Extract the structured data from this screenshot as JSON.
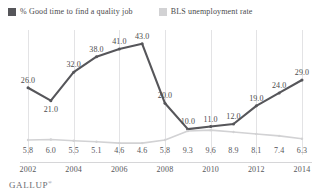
{
  "legend": {
    "items": [
      {
        "label": "% Good time to find a quality job",
        "color": "#56565a",
        "icon": "legend-swatch-dark"
      },
      {
        "label": "BLS unemployment rate",
        "color": "#d2d2d4",
        "icon": "legend-swatch-light"
      }
    ]
  },
  "footer": {
    "brand": "GALLUP",
    "trademark": "®"
  },
  "chart_data": {
    "type": "line",
    "title": "",
    "xlabel": "",
    "ylabel": "",
    "grid": true,
    "legend_position": "top-left",
    "x": [
      2002,
      2003,
      2004,
      2005,
      2006,
      2007,
      2008,
      2009,
      2010,
      2011,
      2012,
      2013,
      2014
    ],
    "tick_labels": [
      "2002",
      "2004",
      "2006",
      "2008",
      "2010",
      "2012",
      "2014"
    ],
    "tick_values": [
      2002,
      2004,
      2006,
      2008,
      2010,
      2012,
      2014
    ],
    "ylim": [
      0,
      46
    ],
    "series": [
      {
        "name": "% Good time to find a quality job",
        "color": "#56565a",
        "values": [
          26.0,
          21.0,
          32.0,
          38.0,
          41.0,
          43.0,
          20.0,
          10.0,
          11.0,
          12.0,
          19.0,
          24.0,
          29.0
        ],
        "labels": [
          "26.0",
          "21.0",
          "32.0",
          "38.0",
          "41.0",
          "43.0",
          "20.0",
          "10.0",
          "11.0",
          "12.0",
          "19.0",
          "24.0",
          "29.0"
        ]
      },
      {
        "name": "BLS unemployment rate",
        "color": "#d2d2d4",
        "values": [
          5.8,
          6.0,
          5.5,
          5.1,
          4.6,
          4.6,
          5.8,
          9.3,
          9.6,
          8.9,
          8.1,
          7.4,
          6.3
        ],
        "labels": [
          "5.8",
          "6.0",
          "5.5",
          "5.1",
          "4.6",
          "4.6",
          "5.8",
          "9.3",
          "9.6",
          "8.9",
          "8.1",
          "7.4",
          "6.3"
        ]
      }
    ]
  }
}
